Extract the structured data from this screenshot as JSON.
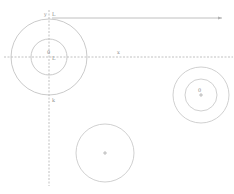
{
  "diagram": {
    "colors": {
      "stroke": "#bdbdbd",
      "axis": "#a8a8a8",
      "text": "#888888"
    },
    "axes": {
      "vertical": {
        "x": 49,
        "y1": 10,
        "y2": 186
      },
      "horizontal": {
        "y": 57,
        "x1": 4,
        "x2": 233
      }
    },
    "arrow": {
      "x1": 52,
      "y1": 18,
      "x2": 222,
      "y2": 18
    },
    "circles": [
      {
        "name": "origin-outer-circle",
        "cx": 49,
        "cy": 57,
        "r": 38
      },
      {
        "name": "origin-inner-circle",
        "cx": 49,
        "cy": 57,
        "r": 18
      },
      {
        "name": "right-outer-circle",
        "cx": 201,
        "cy": 95,
        "r": 28
      },
      {
        "name": "right-inner-circle",
        "cx": 201,
        "cy": 95,
        "r": 16
      },
      {
        "name": "bottom-circle",
        "cx": 105,
        "cy": 153,
        "r": 29
      }
    ],
    "labels": {
      "y_axis": "y",
      "top_point": "L",
      "origin": "0",
      "origin_side": "L",
      "x_axis": "x",
      "bottom_point": "k",
      "right_center": "0"
    }
  }
}
